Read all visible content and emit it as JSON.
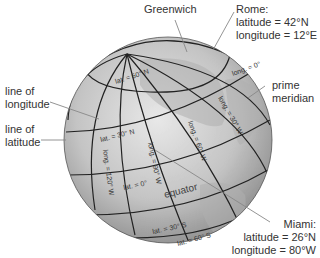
{
  "diagram": {
    "type": "globe-latitude-longitude",
    "callouts": {
      "greenwich": "Greenwich",
      "rome": {
        "title": "Rome:",
        "latitude": "latitude = 42°N",
        "longitude": "longitude = 12°E"
      },
      "line_of_longitude": {
        "line1": "line of",
        "line2": "longitude"
      },
      "line_of_latitude": {
        "line1": "line of",
        "line2": "latitude"
      },
      "prime_meridian": {
        "line1": "prime",
        "line2": "meridian"
      },
      "miami": {
        "title": "Miami:",
        "latitude": "latitude = 26°N",
        "longitude": "longitude = 80°W"
      }
    },
    "globe_labels": {
      "lat_60n": "lat. = 60° N",
      "lat_30n": "lat. = 30° N",
      "lat_0": "lat. = 0°",
      "lat_30s": "lat. = 30° S",
      "lat_60s": "lat. = 60° S",
      "long_0": "long. = 0°",
      "long_30w": "long. = 30° W",
      "long_60w": "long. = 60° W",
      "long_90w": "long. = 90° W",
      "long_120w": "long. = 120° W",
      "equator": "equator"
    },
    "colors": {
      "globe_light": "#e6e6e6",
      "globe_dark": "#8a8a8a",
      "grid_line": "#222222",
      "leader_line": "#888888",
      "text": "#333333"
    }
  }
}
